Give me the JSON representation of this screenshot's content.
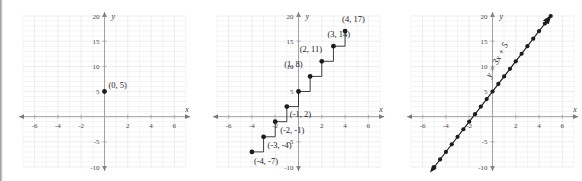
{
  "figure": {
    "panel_count": 3,
    "background_color": "#ffffff",
    "grid_color": "#e8e8ec",
    "axis_color": "#9a9a9a",
    "point_color": "#1c1c1c",
    "label_color": "#1c1c1c"
  },
  "axes_common": {
    "x_label": "x",
    "y_label": "y",
    "xlim": [
      -7,
      7
    ],
    "ylim": [
      -10,
      20
    ],
    "x_ticks": [
      -6,
      -4,
      -2,
      2,
      4,
      6
    ],
    "x_tick_labels": [
      "-6",
      "-4",
      "-2",
      "2",
      "4",
      "6"
    ],
    "y_ticks": [
      20,
      15,
      10,
      5,
      -5,
      -10
    ],
    "y_tick_labels": [
      "20",
      "15",
      "10",
      "5",
      "-5",
      "-10"
    ],
    "grid": true,
    "grid_step": 1
  },
  "chart_data": [
    {
      "type": "scatter",
      "panel": 1,
      "title": "",
      "xlabel": "x",
      "ylabel": "y",
      "xlim": [
        -7,
        7
      ],
      "ylim": [
        -10,
        20
      ],
      "grid": true,
      "x": [
        0
      ],
      "y": [
        5
      ],
      "point_labels": [
        "(0, 5)"
      ],
      "annotations": [
        {
          "text": "(0, 5)",
          "x": 0,
          "y": 5
        }
      ]
    },
    {
      "type": "scatter",
      "panel": 2,
      "title": "",
      "xlabel": "x",
      "ylabel": "y",
      "xlim": [
        -7,
        7
      ],
      "ylim": [
        -10,
        20
      ],
      "grid": true,
      "staircase": true,
      "x": [
        -4,
        -3,
        -2,
        -1,
        0,
        1,
        2,
        3,
        4
      ],
      "y": [
        -7,
        -4,
        -1,
        2,
        5,
        8,
        11,
        14,
        17
      ],
      "point_labels": [
        "(-4, -7)",
        "(-3, -4)",
        "(-2, -1)",
        "(-1, 2)",
        "",
        "(1, 8)",
        "(2, 11)",
        "(3, 14)",
        "(4, 17)"
      ],
      "annotations": [
        {
          "text": "(4, 17)",
          "x": 4,
          "y": 17
        },
        {
          "text": "(3, 14)",
          "x": 3,
          "y": 14
        },
        {
          "text": "(2, 11)",
          "x": 2,
          "y": 11
        },
        {
          "text": "(1, 8)",
          "x": 1,
          "y": 8
        },
        {
          "text": "(-1, 2)",
          "x": -1,
          "y": 2
        },
        {
          "text": "(-2, -1)",
          "x": -2,
          "y": -1
        },
        {
          "text": "(-3, -4)",
          "x": -3,
          "y": -4
        },
        {
          "text": "(-4, -7)",
          "x": -4,
          "y": -7
        }
      ]
    },
    {
      "type": "line",
      "panel": 3,
      "title": "",
      "xlabel": "x",
      "ylabel": "y",
      "xlim": [
        -7,
        7
      ],
      "ylim": [
        -10,
        20
      ],
      "grid": true,
      "equation": "y = 3x + 5",
      "slope": 3,
      "intercept": 5,
      "x": [
        -5,
        -4.5,
        -4,
        -3.5,
        -3,
        -2.5,
        -2,
        -1.5,
        -1,
        -0.5,
        0,
        0.5,
        1,
        1.5,
        2,
        2.5,
        3,
        3.5,
        4,
        4.5,
        5
      ],
      "y": [
        -10,
        -8.5,
        -7,
        -5.5,
        -4,
        -2.5,
        -1,
        0.5,
        2,
        3.5,
        5,
        6.5,
        8,
        9.5,
        11,
        12.5,
        14,
        15.5,
        17,
        18.5,
        20
      ],
      "annotations": [
        {
          "text": "y = 3x + 5",
          "x": 0.6,
          "y": 11
        }
      ]
    }
  ]
}
